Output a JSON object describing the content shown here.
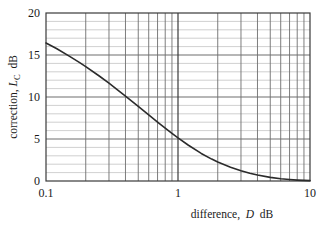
{
  "chart_data": {
    "type": "line",
    "title": "",
    "subtitle": "",
    "xlabel_parts": {
      "lead": "difference,",
      "symbol": "D",
      "unit": "dB"
    },
    "ylabel_parts": {
      "lead": "correction,",
      "symbol": "L",
      "symbol_sub": "C",
      "unit": "dB"
    },
    "xlabel": "difference, D dB",
    "ylabel": "correction, L_C dB",
    "xscale": "log",
    "yscale": "linear",
    "xlim": [
      0.1,
      10
    ],
    "ylim": [
      0,
      20
    ],
    "grid": true,
    "grid_style": "log-minor-x, 1dB-minor-y",
    "legend": "none",
    "xticks": [
      0.1,
      1,
      10
    ],
    "xticklabels": [
      "0.1",
      "1",
      "10"
    ],
    "x_minor_ticks": [
      0.2,
      0.3,
      0.4,
      0.5,
      0.6,
      0.7,
      0.8,
      0.9,
      2,
      3,
      4,
      5,
      6,
      7,
      8,
      9
    ],
    "yticks": [
      0,
      5,
      10,
      15,
      20
    ],
    "yticklabels": [
      "0",
      "5",
      "10",
      "15",
      "20"
    ],
    "y_minor_ticks": [
      1,
      2,
      3,
      4,
      6,
      7,
      8,
      9,
      11,
      12,
      13,
      14,
      16,
      17,
      18,
      19
    ],
    "series": [
      {
        "name": "correction",
        "color": "#2b2b2b",
        "x": [
          0.1,
          0.12,
          0.15,
          0.18,
          0.2,
          0.25,
          0.3,
          0.35,
          0.4,
          0.5,
          0.6,
          0.7,
          0.8,
          0.9,
          1.0,
          1.2,
          1.5,
          1.8,
          2.0,
          2.5,
          3.0,
          3.5,
          4.0,
          5.0,
          6.0,
          7.0,
          8.0,
          9.0,
          10.0
        ],
        "y": [
          16.43,
          15.77,
          14.87,
          14.09,
          13.62,
          12.56,
          11.64,
          10.83,
          10.11,
          8.88,
          7.87,
          7.02,
          6.29,
          5.67,
          5.13,
          4.26,
          3.28,
          2.61,
          2.26,
          1.65,
          1.23,
          0.93,
          0.71,
          0.43,
          0.26,
          0.17,
          0.11,
          0.07,
          0.04
        ]
      }
    ],
    "equation": "L_C = 10 log10(1 + 10^(-D/10))",
    "notable_points": [
      {
        "x": 0.1,
        "y": 16.4
      },
      {
        "x": 1.0,
        "y": 5.1
      },
      {
        "x": 10.0,
        "y": 0.4
      }
    ]
  },
  "colors": {
    "curve": "#2b2b2b",
    "axis": "#3a3a3a",
    "major_grid": "#6e6e6e",
    "minor_grid": "#c4c4c4",
    "background": "#ffffff",
    "text": "#1a1a1a"
  }
}
